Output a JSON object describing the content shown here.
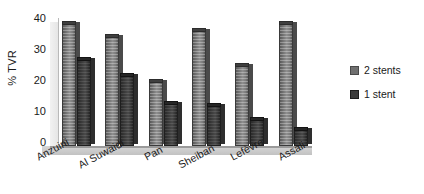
{
  "chart_data": {
    "type": "bar",
    "title": "",
    "xlabel": "",
    "ylabel": "% TVR",
    "ylim": [
      0,
      40
    ],
    "yticks": [
      0,
      10,
      20,
      30,
      40
    ],
    "grid": false,
    "legend_position": "right",
    "categories": [
      "Anzuini",
      "Al Suwaidi",
      "Pan",
      "Sheiban",
      "Lefèvre",
      "Assali"
    ],
    "series": [
      {
        "name": "2 stents",
        "values": [
          38,
          34,
          20,
          36,
          25,
          38
        ],
        "color": "#707070"
      },
      {
        "name": "1 stent",
        "values": [
          27,
          22,
          13,
          12.5,
          8,
          5
        ],
        "color": "#3a3a3a"
      }
    ]
  },
  "axis": {
    "y_label": "% TVR",
    "ticks": [
      "40",
      "30",
      "20",
      "10",
      "0"
    ]
  },
  "legend": {
    "items": [
      {
        "label": "2 stents"
      },
      {
        "label": "1 stent"
      }
    ]
  },
  "categories": [
    {
      "label": "Anzuini"
    },
    {
      "label": "Al Suwaidi"
    },
    {
      "label": "Pan"
    },
    {
      "label": "Sheiban"
    },
    {
      "label": "Lefèvre"
    },
    {
      "label": "Assali"
    }
  ]
}
